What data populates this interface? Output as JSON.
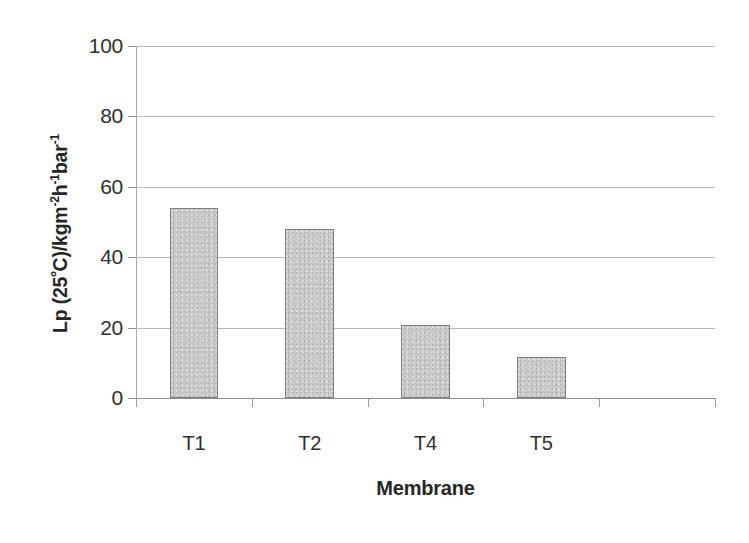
{
  "chart_data": {
    "type": "bar",
    "title": "",
    "categories": [
      "T1",
      "T2",
      "T4",
      "T5"
    ],
    "values": [
      54,
      48,
      20.7,
      11.7
    ],
    "xlabel": "Membrane",
    "ylabel": "Lp (25ºC)/kgm-2h-1bar-1",
    "ylabel_parts": {
      "lead": "Lp (25",
      "degree": "º",
      "mid": "C)/kgm",
      "sup1": "-2",
      "h": "h",
      "sup2": "-1",
      "bar": "bar",
      "sup3": "-1"
    },
    "ylim": [
      0,
      100
    ],
    "ytick_values": [
      0,
      20,
      40,
      60,
      80,
      100
    ],
    "ytick_labels": [
      "0",
      "20",
      "40",
      "60",
      "80",
      "100"
    ],
    "grid": true,
    "grid_axis": "y",
    "legend": "none",
    "bar_color": "#c9c9c9",
    "bar_edge_color": "#7d7d7d",
    "axis_color": "#a8a8a8",
    "gridline_color": "#b9b9b9",
    "text_color": "#2f2f2f",
    "n_slots": 5,
    "empty_slot_index": 4
  }
}
